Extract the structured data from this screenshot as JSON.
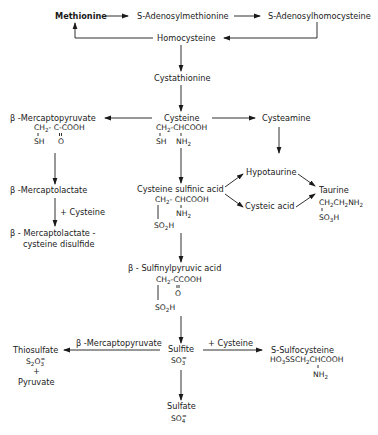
{
  "diagram": {
    "type": "metabolic-pathway",
    "nodes": {
      "methionine": {
        "label": "Methionine"
      },
      "sam": {
        "label": "S-Adenosylmethionine"
      },
      "sah": {
        "label": "S-Adenosylhomocysteine"
      },
      "homocysteine": {
        "label": "Homocysteine"
      },
      "cystathionine": {
        "label": "Cystathionine"
      },
      "cysteine": {
        "label": "Cysteine",
        "formula_l1": "CH2-CHCOOH",
        "formula_l2a": "SH",
        "formula_l2b": "NH2"
      },
      "mercaptopyruvate": {
        "label": "β -Mercaptopyruvate",
        "formula_l1": "CH2- C-COOH",
        "formula_l2a": "SH",
        "formula_l2b": "O"
      },
      "cysteamine": {
        "label": "Cysteamine"
      },
      "mercaptolactate": {
        "label": "β -Mercaptolactate"
      },
      "disulfide": {
        "label_l1": "β - Mercaptolactate -",
        "label_l2": "cysteine disulfide"
      },
      "cysteine_sulfinic": {
        "label": "Cysteine sulfinic acid",
        "formula_l1": "CH2-CHCOOH",
        "formula_l2": "NH2",
        "formula_l3": "SO2H"
      },
      "hypotaurine": {
        "label": "Hypotaurine"
      },
      "cysteic_acid": {
        "label": "Cysteic acid"
      },
      "taurine": {
        "label": "Taurine",
        "formula_l1": "CH2CH2NH2",
        "formula_l2": "SO3H"
      },
      "sulfinylpyruvic": {
        "label": "β - Sulfinylpyruvic acid",
        "formula_l1": "CH2-CCOOH",
        "formula_l2": "O",
        "formula_l3": "SO2H"
      },
      "sulfite": {
        "label": "Sulfite",
        "formula": "SO3="
      },
      "thiosulfate": {
        "label": "Thiosulfate",
        "formula": "S2O3=",
        "plus": "+",
        "coproduct": "Pyruvate"
      },
      "sulfocysteine": {
        "label": "S-Sulfocysteine",
        "formula_l1": "HO3SSCH2CHCOOH",
        "formula_l2": "NH2"
      },
      "sulfate": {
        "label": "Sulfate",
        "formula": "SO4="
      }
    },
    "edge_labels": {
      "mercaptolactate_to_disulfide": "+ Cysteine",
      "sulfite_to_thiosulfate": "β -Mercaptopyruvate",
      "sulfite_to_sulfocysteine": "+ Cysteine"
    },
    "edges": [
      {
        "from": "methionine",
        "to": "sam"
      },
      {
        "from": "sam",
        "to": "sah"
      },
      {
        "from": "sah",
        "to": "homocysteine"
      },
      {
        "from": "homocysteine",
        "to": "methionine"
      },
      {
        "from": "homocysteine",
        "to": "cystathionine"
      },
      {
        "from": "cystathionine",
        "to": "cysteine"
      },
      {
        "from": "cysteine",
        "to": "mercaptopyruvate"
      },
      {
        "from": "cysteine",
        "to": "cysteamine"
      },
      {
        "from": "cysteine",
        "to": "cysteine_sulfinic"
      },
      {
        "from": "mercaptopyruvate",
        "to": "mercaptolactate"
      },
      {
        "from": "mercaptolactate",
        "to": "disulfide",
        "label": "+ Cysteine"
      },
      {
        "from": "cysteamine",
        "to": "hypotaurine"
      },
      {
        "from": "cysteine_sulfinic",
        "to": "hypotaurine"
      },
      {
        "from": "cysteine_sulfinic",
        "to": "cysteic_acid"
      },
      {
        "from": "hypotaurine",
        "to": "taurine"
      },
      {
        "from": "cysteic_acid",
        "to": "taurine"
      },
      {
        "from": "cysteine_sulfinic",
        "to": "sulfinylpyruvic"
      },
      {
        "from": "sulfinylpyruvic",
        "to": "sulfite"
      },
      {
        "from": "sulfite",
        "to": "thiosulfate",
        "label": "β -Mercaptopyruvate"
      },
      {
        "from": "sulfite",
        "to": "sulfocysteine",
        "label": "+ Cysteine"
      },
      {
        "from": "sulfite",
        "to": "sulfate"
      }
    ]
  }
}
